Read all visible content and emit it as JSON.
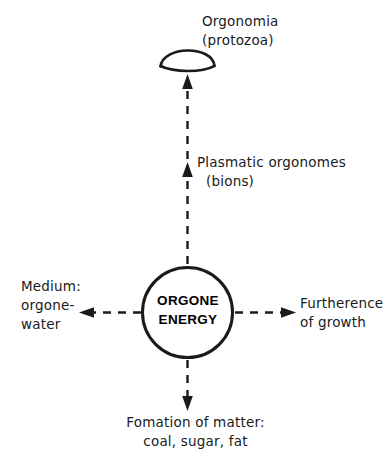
{
  "diagram": {
    "core": {
      "label_line1": "ORGONE",
      "label_line2": "ENERGY",
      "shape": "circle"
    },
    "nodes": {
      "top": {
        "icon": "protozoa-crescent-icon",
        "line1": "Orgonomia",
        "line2": "(protozoa)"
      },
      "middle": {
        "line1": "Plasmatic orgonomes",
        "line2": "(bions)"
      },
      "left": {
        "line1": "Medium:",
        "line2": "orgone-",
        "line3": "water"
      },
      "right": {
        "line1": "Furtherence",
        "line2": "of growth"
      },
      "bottom": {
        "line1": "Fomation of matter:",
        "line2": "coal, sugar, fat"
      }
    },
    "colors": {
      "stroke": "#1a1a1a",
      "background": "#ffffff",
      "text": "#1a1a1a"
    },
    "arrows": {
      "style": "dashed",
      "directions": [
        "up",
        "up-mid",
        "left",
        "right",
        "down"
      ]
    }
  }
}
